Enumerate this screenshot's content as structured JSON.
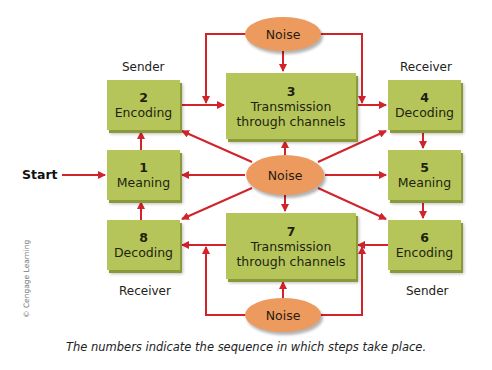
{
  "diagram": {
    "start_label": "Start",
    "noise_label": "Noise",
    "steps": [
      {
        "num": "1",
        "label": "Meaning"
      },
      {
        "num": "2",
        "label": "Encoding"
      },
      {
        "num": "3",
        "label": "Transmission through channels"
      },
      {
        "num": "4",
        "label": "Decoding"
      },
      {
        "num": "5",
        "label": "Meaning"
      },
      {
        "num": "6",
        "label": "Encoding"
      },
      {
        "num": "7",
        "label": "Transmission through channels"
      },
      {
        "num": "8",
        "label": "Decoding"
      }
    ],
    "role_labels": {
      "top_left": "Sender",
      "top_right": "Receiver",
      "bottom_left": "Receiver",
      "bottom_right": "Sender"
    },
    "caption": "The numbers indicate the sequence in which steps take place.",
    "credit": "© Cengage Learning",
    "colors": {
      "box": "#b5c55a",
      "noise": "#ec9a5e",
      "arrow": "#d0232a"
    }
  }
}
